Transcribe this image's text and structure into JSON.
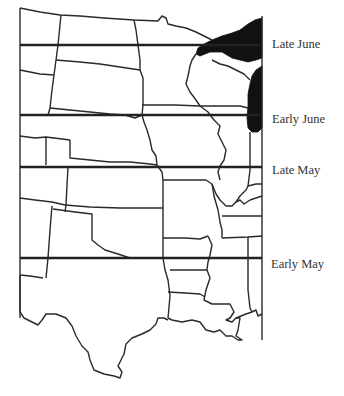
{
  "map": {
    "title": "",
    "region": "Central United States",
    "bands": [
      {
        "id": "late-june",
        "label": "Late June",
        "y": 45
      },
      {
        "id": "early-june",
        "label": "Early June",
        "y": 115
      },
      {
        "id": "late-may",
        "label": "Late May",
        "y": 167
      },
      {
        "id": "early-may",
        "label": "Early May",
        "y": 258
      }
    ],
    "colors": {
      "lines": "#222222",
      "water": "#111111",
      "background": "#ffffff"
    }
  }
}
